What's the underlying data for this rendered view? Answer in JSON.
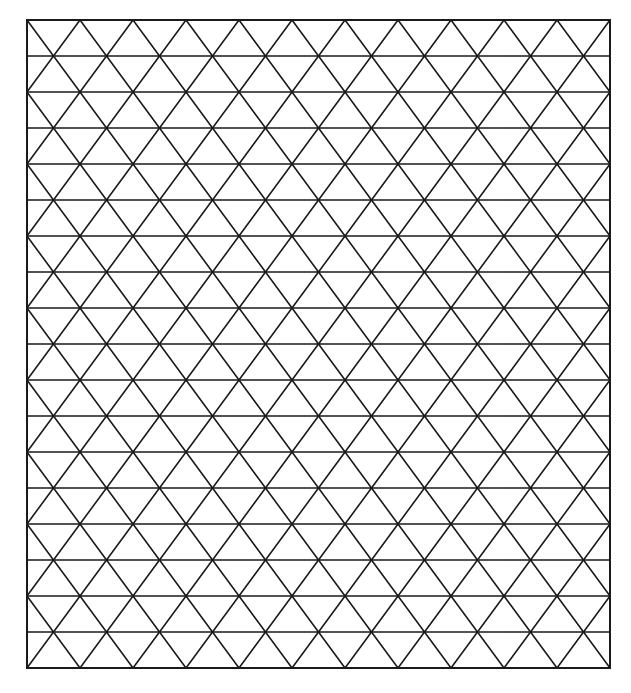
{
  "figure": {
    "type": "isometric-triangle-grid",
    "background": "#ffffff",
    "line_color": "#1a1a1a",
    "line_width": 1.6,
    "border_width": 2,
    "bounds": {
      "left": 27,
      "top": 20,
      "right": 610,
      "bottom": 668
    },
    "columns": 11,
    "rows": 18
  }
}
